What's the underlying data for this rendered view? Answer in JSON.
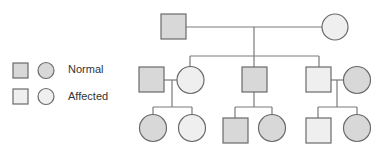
{
  "diagram": {
    "type": "pedigree",
    "colors": {
      "normal_fill": "#d8d8d8",
      "affected_fill": "#efefef",
      "stroke": "#6a6a6a",
      "line": "#7a7a7a"
    }
  },
  "legend": {
    "items": [
      {
        "label": "Normal",
        "status": "normal"
      },
      {
        "label": "Affected",
        "status": "affected"
      }
    ]
  },
  "generations": [
    {
      "id": "I",
      "individuals": [
        {
          "id": "I-1",
          "sex": "male",
          "status": "normal"
        },
        {
          "id": "I-2",
          "sex": "female",
          "status": "affected"
        }
      ]
    },
    {
      "id": "II",
      "individuals": [
        {
          "id": "II-1",
          "sex": "male",
          "status": "normal",
          "note": "spouse"
        },
        {
          "id": "II-2",
          "sex": "female",
          "status": "affected"
        },
        {
          "id": "II-3",
          "sex": "male",
          "status": "normal"
        },
        {
          "id": "II-4",
          "sex": "male",
          "status": "affected"
        },
        {
          "id": "II-5",
          "sex": "female",
          "status": "normal",
          "note": "spouse"
        }
      ]
    },
    {
      "id": "III",
      "individuals": [
        {
          "id": "III-1",
          "sex": "female",
          "status": "normal"
        },
        {
          "id": "III-2",
          "sex": "female",
          "status": "affected"
        },
        {
          "id": "III-3",
          "sex": "male",
          "status": "normal"
        },
        {
          "id": "III-4",
          "sex": "female",
          "status": "normal"
        },
        {
          "id": "III-5",
          "sex": "male",
          "status": "affected"
        },
        {
          "id": "III-6",
          "sex": "female",
          "status": "normal"
        }
      ]
    }
  ]
}
